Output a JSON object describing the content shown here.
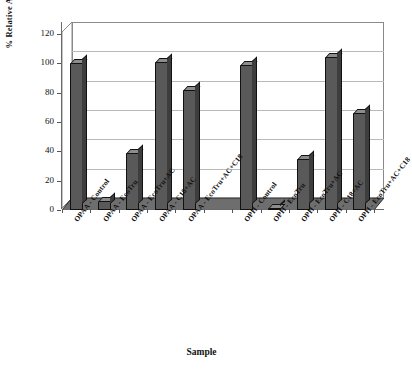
{
  "chart_data": {
    "type": "bar",
    "title": "",
    "xlabel": "Sample",
    "ylabel": "% Relative ACtivity",
    "ylim": [
      0,
      120
    ],
    "yticks": [
      0,
      20,
      40,
      60,
      80,
      100,
      120
    ],
    "grid": true,
    "legend": "none",
    "style": "3d-column",
    "categories": [
      "OPAA - Control",
      "OPAA - EcoTru",
      "OPAA - EcoTru+AC",
      "OPAA - C18+AC",
      "OPAA - EcoTru+AC+C18",
      "",
      "OPH - Control",
      "OPH - EcoTru",
      "OPH - EcoTru+AC",
      "OPH - C18+AC",
      "OPH - EcoTru+AC+C18"
    ],
    "values": [
      100,
      6,
      39,
      101,
      82,
      null,
      99,
      1,
      35,
      104,
      66
    ],
    "colors": {
      "bar_face": "#595959",
      "bar_top": "#8d8d8d",
      "bar_side": "#3d3d3d",
      "floor": "#6e6e6e",
      "gridline": "#b9b9b9",
      "axis": "#6a6a6a",
      "text": "#111111",
      "background": "#ffffff"
    }
  }
}
